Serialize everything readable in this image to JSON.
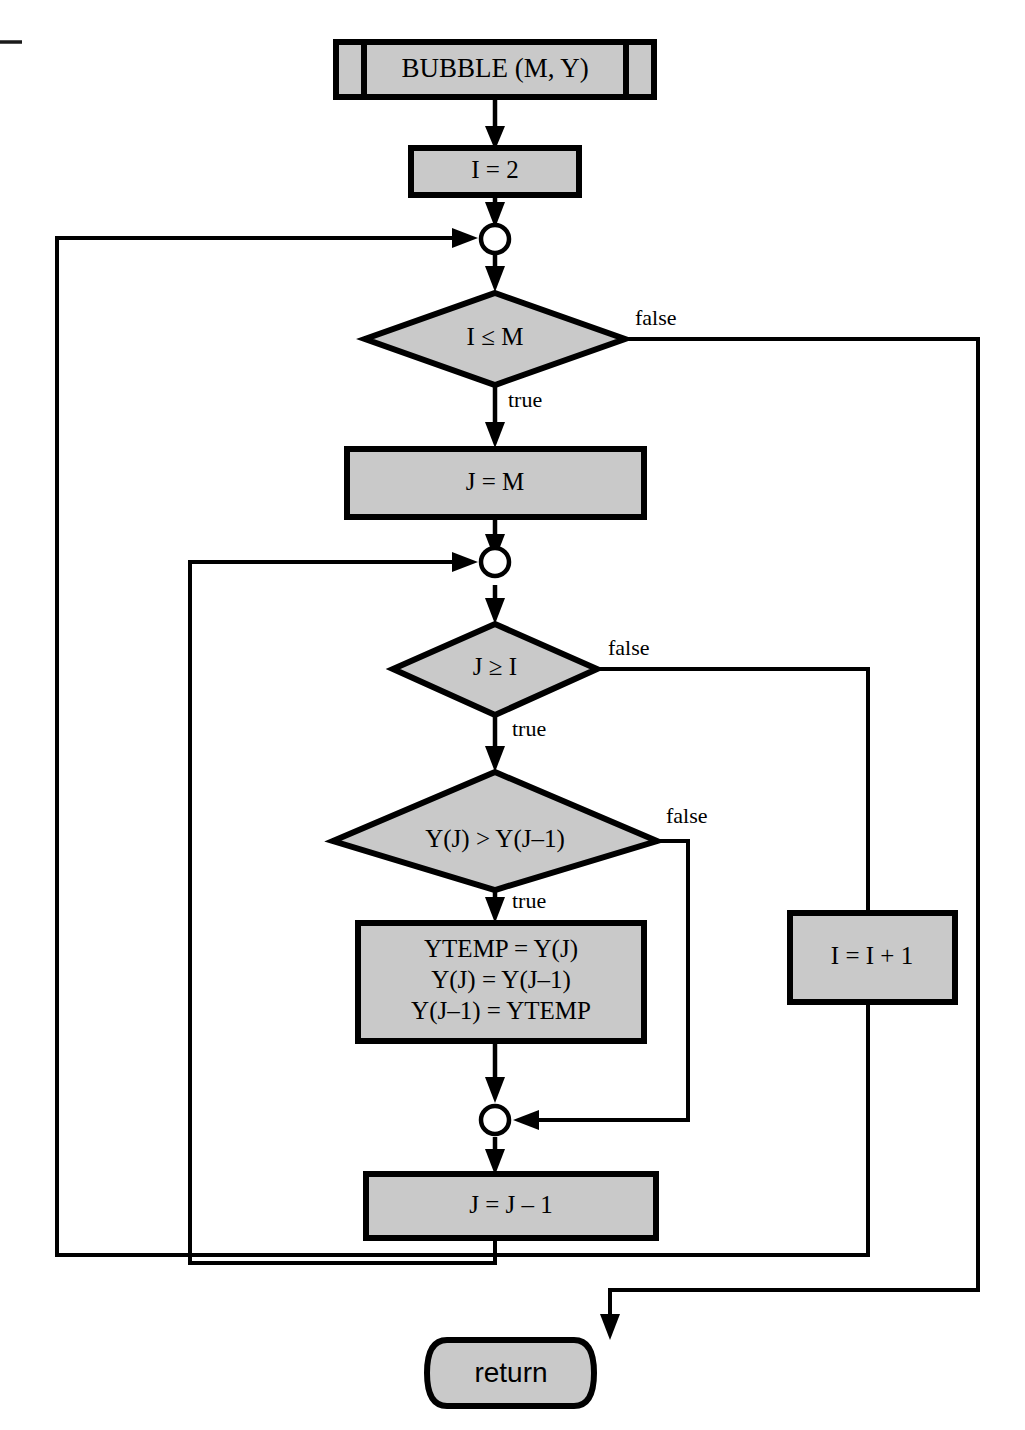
{
  "diagram": {
    "title": "BUBBLE (M, Y)",
    "type": "flowchart",
    "colors": {
      "node_fill": "#c9c9c9",
      "stroke": "#000000",
      "background": "#ffffff"
    },
    "nodes": {
      "subroutine_header": {
        "label": "BUBBLE (M, Y)",
        "shape": "subroutine"
      },
      "init_i": {
        "label": "I = 2",
        "shape": "process"
      },
      "merge_outer": {
        "label": "",
        "shape": "connector-circle"
      },
      "decision_i_le_m": {
        "label": "I ≤ M",
        "shape": "decision"
      },
      "assign_j": {
        "label": "J = M",
        "shape": "process"
      },
      "merge_inner": {
        "label": "",
        "shape": "connector-circle"
      },
      "decision_j_ge_i": {
        "label": "J ≥ I",
        "shape": "decision"
      },
      "decision_compare": {
        "label": "Y(J) > Y(J–1)",
        "shape": "decision"
      },
      "swap_block": {
        "shape": "process",
        "lines": [
          "YTEMP = Y(J)",
          "Y(J) = Y(J–1)",
          "Y(J–1) = YTEMP"
        ]
      },
      "merge_swap": {
        "label": "",
        "shape": "connector-circle"
      },
      "decrement_j": {
        "label": "J = J – 1",
        "shape": "process"
      },
      "increment_i": {
        "label": "I = I + 1",
        "shape": "process"
      },
      "return_terminal": {
        "label": "return",
        "shape": "terminal"
      }
    },
    "edge_labels": {
      "i_le_m_false": "false",
      "i_le_m_true": "true",
      "j_ge_i_false": "false",
      "j_ge_i_true": "true",
      "compare_false": "false",
      "compare_true": "true"
    }
  }
}
